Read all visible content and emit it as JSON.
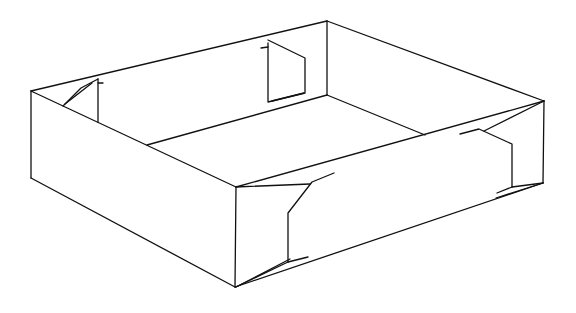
{
  "diagram": {
    "stroke_color": "#111111",
    "background_color": "#ffffff",
    "parts": [
      "left-outer-wall",
      "front-outer-wall",
      "back-inner-wall",
      "right-inner-wall",
      "inner-floor-edges",
      "left-back-corner-flap",
      "back-corner-flap",
      "front-corner-flap",
      "right-corner-flap"
    ]
  }
}
